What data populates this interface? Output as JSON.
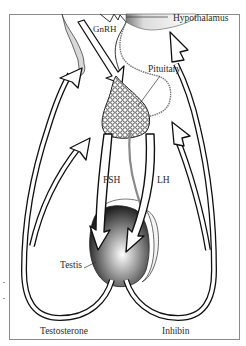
{
  "diagram": {
    "type": "physiology-feedback-loop",
    "labels": {
      "hypothalamus": "Hypothalamus",
      "gnrh": "GnRH",
      "pituitary": "Pituitary",
      "fsh": "FSH",
      "lh": "LH",
      "testis": "Testis",
      "testosterone": "Testosterone",
      "inhibin": "Inhibin"
    },
    "nodes": [
      {
        "id": "hypothalamus",
        "label": "Hypothalamus"
      },
      {
        "id": "pituitary",
        "label": "Pituitary"
      },
      {
        "id": "testis",
        "label": "Testis"
      }
    ],
    "edges": [
      {
        "from": "hypothalamus",
        "to": "pituitary",
        "label": "GnRH"
      },
      {
        "from": "pituitary",
        "to": "testis",
        "label": "FSH"
      },
      {
        "from": "pituitary",
        "to": "testis",
        "label": "LH"
      },
      {
        "from": "testis",
        "to": "hypothalamus",
        "label": "Testosterone",
        "side": "left"
      },
      {
        "from": "testis",
        "to": "pituitary",
        "label": "Testosterone",
        "side": "left"
      },
      {
        "from": "testis",
        "to": "hypothalamus",
        "label": "Inhibin",
        "side": "right"
      },
      {
        "from": "testis",
        "to": "pituitary",
        "label": "Inhibin",
        "side": "right"
      }
    ],
    "colors": {
      "ink": "#111111",
      "frame": "#8a8a8a",
      "background": "#ffffff",
      "shade": "#6a6a6a"
    }
  }
}
